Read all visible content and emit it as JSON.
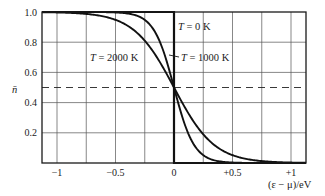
{
  "chart_data": {
    "type": "line",
    "title": "",
    "xlabel": "(ε − μ)/eV",
    "ylabel": "n̄",
    "xlim": [
      -1.12,
      1.12
    ],
    "ylim": [
      0,
      1.0
    ],
    "grid": true,
    "grid_x_step": 0.25,
    "grid_y_step": 0.2,
    "reference_line": {
      "y": 0.5,
      "style": "dashed"
    },
    "x_ticks": [
      {
        "value": -1,
        "label": "−1"
      },
      {
        "value": -0.5,
        "label": "−0.5"
      },
      {
        "value": 0,
        "label": "0"
      },
      {
        "value": 0.5,
        "label": "+0.5"
      },
      {
        "value": 1,
        "label": "+1"
      }
    ],
    "y_ticks": [
      {
        "value": 0.2,
        "label": "0.2"
      },
      {
        "value": 0.4,
        "label": "0.4"
      },
      {
        "value": 0.6,
        "label": "0.6"
      },
      {
        "value": 0.8,
        "label": "0.8"
      },
      {
        "value": 1.0,
        "label": "1.0"
      }
    ],
    "function": "n̄ = 1 / (exp((ε − μ)/kT) + 1)",
    "series": [
      {
        "name": "T = 0 K",
        "kT_eV": 0,
        "x": [
          -1.12,
          -0.5,
          0,
          0,
          0.5,
          1.12
        ],
        "values": [
          1,
          1,
          1,
          0,
          0,
          0
        ]
      },
      {
        "name": "T = 1000 K",
        "kT_eV": 0.0862,
        "x": [
          -1.0,
          -0.5,
          -0.4,
          -0.3,
          -0.2,
          -0.1,
          0,
          0.1,
          0.2,
          0.3,
          0.4,
          0.5,
          1.0
        ],
        "values": [
          1.0,
          1.0,
          0.99,
          0.97,
          0.91,
          0.76,
          0.5,
          0.24,
          0.09,
          0.03,
          0.01,
          0.0,
          0.0
        ]
      },
      {
        "name": "T = 2000 K",
        "kT_eV": 0.1723,
        "x": [
          -1.0,
          -0.75,
          -0.5,
          -0.4,
          -0.3,
          -0.2,
          -0.1,
          0,
          0.1,
          0.2,
          0.3,
          0.4,
          0.5,
          0.75,
          1.0
        ],
        "values": [
          1.0,
          0.99,
          0.95,
          0.91,
          0.85,
          0.76,
          0.64,
          0.5,
          0.36,
          0.24,
          0.15,
          0.09,
          0.05,
          0.01,
          0.0
        ]
      }
    ],
    "annotations": [
      {
        "text": "T = 0 K",
        "x": 0.04,
        "y": 0.91
      },
      {
        "text": "T = 1000 K",
        "x": 0.06,
        "y": 0.71,
        "leader": true
      },
      {
        "text": "T = 2000 K",
        "x": -0.72,
        "y": 0.71
      }
    ]
  },
  "labels": {
    "y_axis": "n̄",
    "x_axis": "(ε − μ)/eV",
    "t0": {
      "T": "T",
      "rest": " = 0 K"
    },
    "t1000": {
      "T": "T",
      "rest": " = 1000 K"
    },
    "t2000": {
      "T": "T",
      "rest": " = 2000 K"
    }
  }
}
